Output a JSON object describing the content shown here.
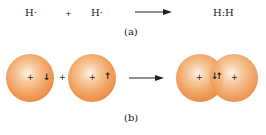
{
  "part_a": {
    "reactant1": "H·",
    "plus": "+",
    "reactant2": "H·",
    "product": "H:H",
    "caption": "(a)"
  },
  "part_b": {
    "atom1": {
      "nucleus": "+",
      "spin": "↓"
    },
    "plus": "+",
    "atom2": {
      "nucleus": "+",
      "spin": "↑"
    },
    "molecule": {
      "nucleus_left": "+",
      "shared_spins": "↓↑",
      "nucleus_right": "+"
    },
    "caption": "(b)"
  },
  "colors": {
    "sphere": "#ee9a55",
    "sphere_highlight": "#fdf2e6",
    "text": "#222222"
  }
}
